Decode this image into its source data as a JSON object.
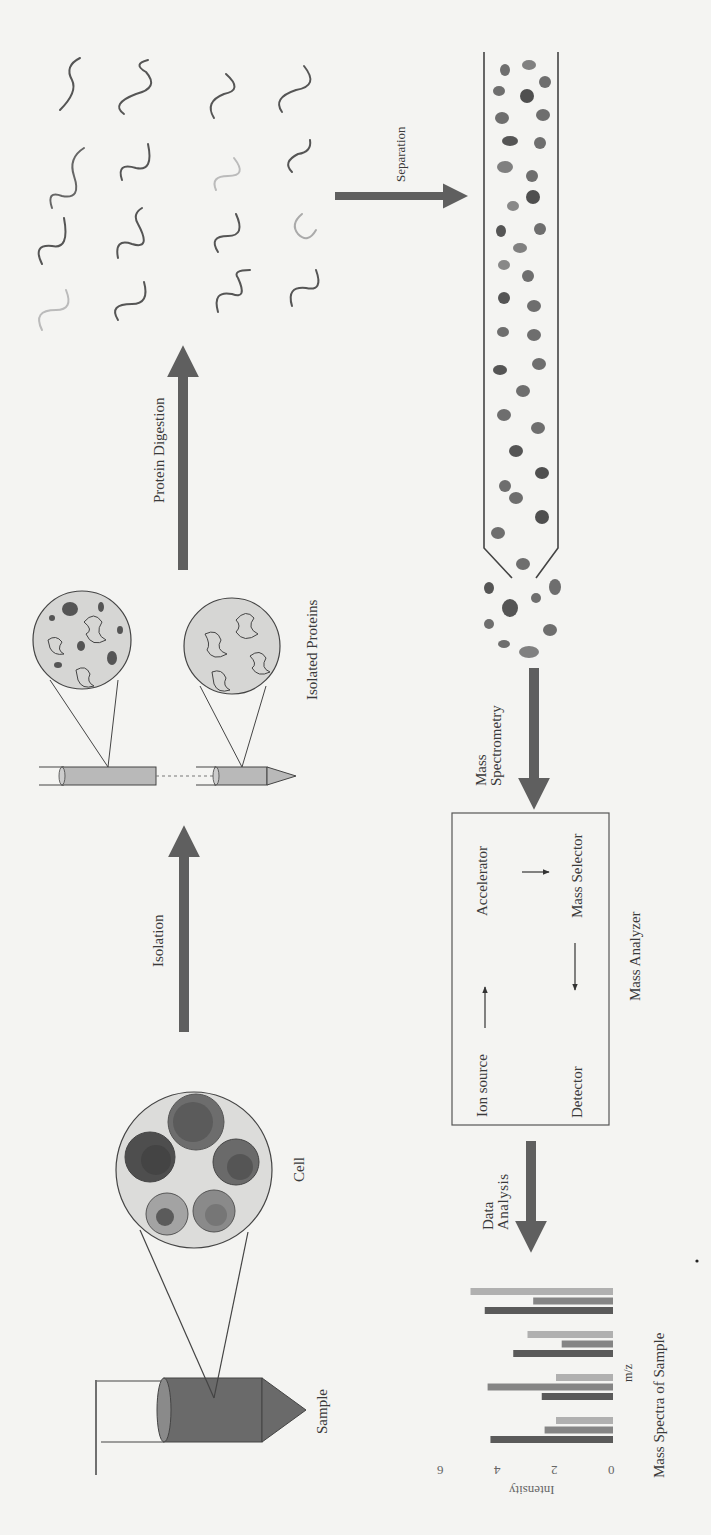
{
  "diagram": {
    "orientation": "rotated 90deg counter-clockwise",
    "colors": {
      "arrow": "#5f5f5f",
      "background": "#f4f4f2",
      "circle_fill": "#d6d6d4",
      "dark": "#505050",
      "mid": "#7a7a7a",
      "light": "#a8a8a8"
    },
    "stages": {
      "sample": {
        "label": "Sample"
      },
      "cell": {
        "label": "Cell"
      },
      "isolated_proteins": {
        "label": "Isolated Proteins"
      },
      "peptides": {
        "label": ""
      },
      "column": {
        "label": ""
      },
      "mass_analyzer": {
        "label": "Mass Analyzer",
        "components": [
          "Ion source",
          "Accelerator",
          "Mass Selector",
          "Detector"
        ]
      },
      "mass_spectra": {
        "label": "Mass Spectra of Sample"
      }
    },
    "arrows": {
      "isolation": "Isolation",
      "protein_digestion": "Protein Digestion",
      "separation": "Separation",
      "mass_spectrometry_line1": "Mass",
      "mass_spectrometry_line2": "Spectrometry",
      "data_analysis_line1": "Data",
      "data_analysis_line2": "Analysis"
    }
  },
  "chart_data": {
    "type": "bar",
    "title": "Mass Spectra of Sample",
    "xlabel": "m/z",
    "ylabel": "Intensity",
    "ylim": [
      0,
      6
    ],
    "yticks": [
      "0",
      "2",
      "4",
      "6"
    ],
    "categories": [
      "1",
      "2",
      "3",
      "4"
    ],
    "series": [
      {
        "name": "series-dark",
        "color": "#5a5a5a",
        "values": [
          4.3,
          2.5,
          3.5,
          4.5
        ]
      },
      {
        "name": "series-mid",
        "color": "#858585",
        "values": [
          2.4,
          4.4,
          1.8,
          2.8
        ]
      },
      {
        "name": "series-light",
        "color": "#b0b0b0",
        "values": [
          2.0,
          2.0,
          3.0,
          5.0
        ]
      }
    ],
    "grid": false,
    "legend": "none"
  }
}
